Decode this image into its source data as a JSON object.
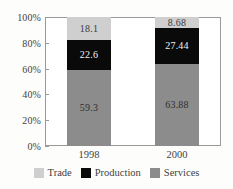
{
  "chart_data": {
    "type": "bar",
    "subtype": "stacked-percent",
    "title": "",
    "xlabel": "",
    "ylabel": "",
    "categories": [
      "1998",
      "2000"
    ],
    "series": [
      {
        "name": "Trade",
        "values": [
          18.1,
          8.68
        ],
        "color": "#cfcfcf",
        "label_color": "#3a3a3a"
      },
      {
        "name": "Production",
        "values": [
          22.6,
          27.44
        ],
        "color": "#0a0a0a",
        "label_color": "#f2f2f2"
      },
      {
        "name": "Services",
        "values": [
          59.3,
          63.88
        ],
        "color": "#8c8c8c",
        "label_color": "#2e2e2e"
      }
    ],
    "stack_order_top_to_bottom": [
      "Trade",
      "Production",
      "Services"
    ],
    "ylim": [
      0,
      100
    ],
    "yticks": [
      0,
      20,
      40,
      60,
      80,
      100
    ],
    "ytick_labels": [
      "0%",
      "20%",
      "40%",
      "60%",
      "80%",
      "100%"
    ],
    "grid": false,
    "legend_position": "bottom",
    "legend_entries": [
      "Trade",
      "Production",
      "Services"
    ],
    "value_labels": {
      "1998": {
        "Trade": "18.1",
        "Production": "22.6",
        "Services": "59.3"
      },
      "2000": {
        "Trade": "8.68",
        "Production": "27.44",
        "Services": "63.88"
      }
    },
    "axis_color": "#9a9a9a",
    "background_color": "#fdfdfb",
    "plot_background_color": "#ffffff"
  }
}
